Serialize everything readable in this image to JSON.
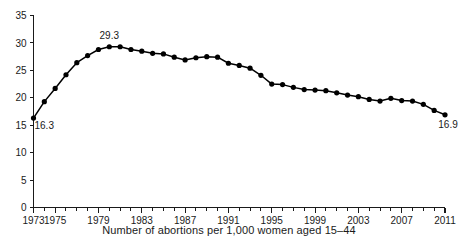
{
  "chart_data": {
    "type": "line",
    "title": "",
    "subtitle": "",
    "xlabel": "Number of abortions per 1,000 women aged 15–44",
    "ylabel": "",
    "xlim": [
      1973,
      2011
    ],
    "ylim": [
      0,
      35
    ],
    "grid": false,
    "legend": "none",
    "x": [
      1973,
      1974,
      1975,
      1976,
      1977,
      1978,
      1979,
      1980,
      1981,
      1982,
      1983,
      1984,
      1985,
      1986,
      1987,
      1988,
      1989,
      1990,
      1991,
      1992,
      1993,
      1994,
      1995,
      1996,
      1997,
      1998,
      1999,
      2000,
      2001,
      2002,
      2003,
      2004,
      2005,
      2006,
      2007,
      2008,
      2009,
      2010,
      2011
    ],
    "values": [
      16.3,
      19.3,
      21.7,
      24.2,
      26.4,
      27.7,
      28.8,
      29.3,
      29.3,
      28.8,
      28.5,
      28.1,
      28.0,
      27.4,
      26.9,
      27.3,
      27.5,
      27.4,
      26.3,
      25.9,
      25.4,
      24.1,
      22.5,
      22.4,
      21.9,
      21.5,
      21.4,
      21.3,
      20.9,
      20.5,
      20.2,
      19.7,
      19.4,
      19.9,
      19.5,
      19.4,
      18.8,
      17.7,
      16.9
    ],
    "annotations": [
      {
        "label": "16.3",
        "x": 1973,
        "y": 16.3,
        "position": "below-right"
      },
      {
        "label": "29.3",
        "x": 1980,
        "y": 29.3,
        "position": "above"
      },
      {
        "label": "16.9",
        "x": 2011,
        "y": 16.9,
        "position": "below-left"
      }
    ],
    "y_ticks": [
      0,
      5,
      10,
      15,
      20,
      25,
      30,
      35
    ],
    "y_tick_labels": [
      "0",
      "5",
      "10",
      "15",
      "20",
      "25",
      "30",
      "35"
    ],
    "x_ticks_labeled": [
      1973,
      1975,
      1979,
      1983,
      1987,
      1991,
      1995,
      1999,
      2003,
      2007,
      2011
    ],
    "x_tick_labels": [
      "1973",
      "1975",
      "1979",
      "1983",
      "1987",
      "1991",
      "1995",
      "1999",
      "2003",
      "2007",
      "2011"
    ],
    "x_ticks_minor_step": 1,
    "series_color": "#000000",
    "axis_color": "#1a1a1a",
    "marker": "circle"
  }
}
